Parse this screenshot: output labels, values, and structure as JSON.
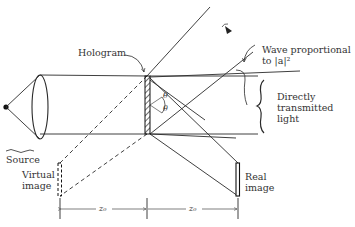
{
  "figure": {
    "type": "optics-diagram",
    "labels": {
      "hologram": "Hologram",
      "wave": "Wave proportional",
      "wave_line2": "to |a|²",
      "direct_1": "Directly",
      "direct_2": "transmitted",
      "direct_3": "light",
      "source": "Source",
      "virtual_1": "Virtual",
      "virtual_2": "image",
      "real_1": "Real",
      "real_2": "image",
      "theta_top": "θ",
      "theta_bottom": "θ",
      "z_left": "z₀",
      "z_right": "z₀"
    },
    "colors": {
      "line": "#2a2a2a",
      "text": "#333333",
      "background": "#ffffff"
    }
  }
}
